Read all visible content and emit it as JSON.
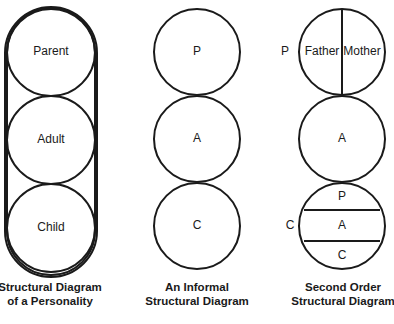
{
  "diagrams": [
    {
      "id": "personality",
      "caption": [
        "Structural Diagram",
        "of a Personality"
      ],
      "circles": [
        {
          "label": "Parent"
        },
        {
          "label": "Adult"
        },
        {
          "label": "Child"
        }
      ]
    },
    {
      "id": "informal",
      "caption": [
        "An Informal",
        "Structural Diagram"
      ],
      "circles": [
        {
          "label": "P"
        },
        {
          "label": "A"
        },
        {
          "label": "C"
        }
      ]
    },
    {
      "id": "second-order",
      "caption": [
        "Second Order",
        "Structural Diagram"
      ],
      "side_labels": {
        "parent": "P",
        "child": "C"
      },
      "parent_split": [
        "Father",
        "Mother"
      ],
      "adult": "A",
      "child_bands": [
        "P",
        "A",
        "C"
      ]
    }
  ]
}
